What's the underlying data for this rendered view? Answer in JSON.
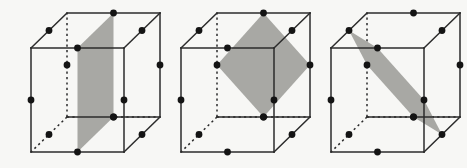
{
  "figure": {
    "background_color": "#f7f7f5",
    "line_color": "#2b2b2b",
    "section_fill_color": "#a8a8a4",
    "dot_color": "#141414",
    "dot_radius": 3.4,
    "panel_count": 3,
    "projection": "oblique-cabinet",
    "cube_front_width": 93,
    "cube_front_height": 104,
    "depth_dx": 36,
    "depth_dy": -35
  },
  "panels": [
    {
      "id": "panel-square",
      "label": "square cross section",
      "origin_x": 31,
      "origin_y": 48,
      "section_type": "square",
      "section_vertex_count": 4,
      "section_points": "0.5,0,0 0.5,1,0 0.5,1,1 0.5,0,1",
      "dot_count": 12
    },
    {
      "id": "panel-diamond",
      "label": "rhombus cross section",
      "origin_x": 181,
      "origin_y": 48,
      "section_type": "rhombus",
      "section_vertex_count": 4,
      "section_points": "0.5,0,1 1,0.5,1 0.5,1,1 0,0.5,1",
      "dot_count": 12
    },
    {
      "id": "panel-hexagon",
      "label": "regular hexagon cross section",
      "origin_x": 331,
      "origin_y": 48,
      "section_type": "hexagon",
      "section_vertex_count": 6,
      "section_points": "0.5,0,0 1,0.5,0 1,1,0.5 0.5,1,1 0,0.5,1 0,0,0.5",
      "dot_count": 12
    }
  ],
  "geometry": {
    "cube_vertices_label": "8 cube corners",
    "edge_midpoints_label": "12 edge midpoints marked with dots",
    "hidden_edges_label": "3 hidden edges drawn dotted"
  }
}
